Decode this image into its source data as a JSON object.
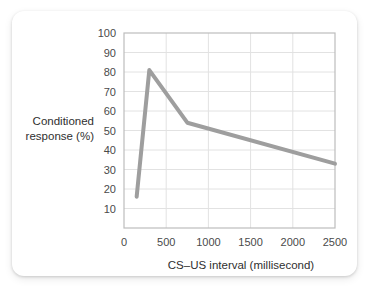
{
  "chart_data": {
    "type": "line",
    "title": "",
    "xlabel": "CS–US interval (millisecond)",
    "ylabel": "Conditioned response (%)",
    "ylabel_lines": [
      "Conditioned",
      "response (%)"
    ],
    "xlim": [
      0,
      2500
    ],
    "ylim": [
      0,
      100
    ],
    "grid": true,
    "legend": "none",
    "xticks": [
      0,
      500,
      1000,
      1500,
      2000,
      2500
    ],
    "xtick_labels": [
      "0",
      "500",
      "1000",
      "1500",
      "2000",
      "2500"
    ],
    "yticks": [
      10,
      20,
      30,
      40,
      50,
      60,
      70,
      80,
      90,
      100
    ],
    "ytick_labels": [
      "10",
      "20",
      "30",
      "40",
      "50",
      "60",
      "70",
      "80",
      "90",
      "100"
    ],
    "series": [
      {
        "name": "Conditioned response",
        "color": "#9e9e9e",
        "line_width": 4,
        "x": [
          150,
          300,
          750,
          2500
        ],
        "y": [
          16,
          81,
          54,
          33
        ]
      }
    ]
  },
  "colors": {
    "line": "#9e9e9e",
    "grid": "#e2e2e2",
    "axis": "#bdbdbd",
    "text": "#3b3b3b",
    "card": "#ffffff"
  }
}
